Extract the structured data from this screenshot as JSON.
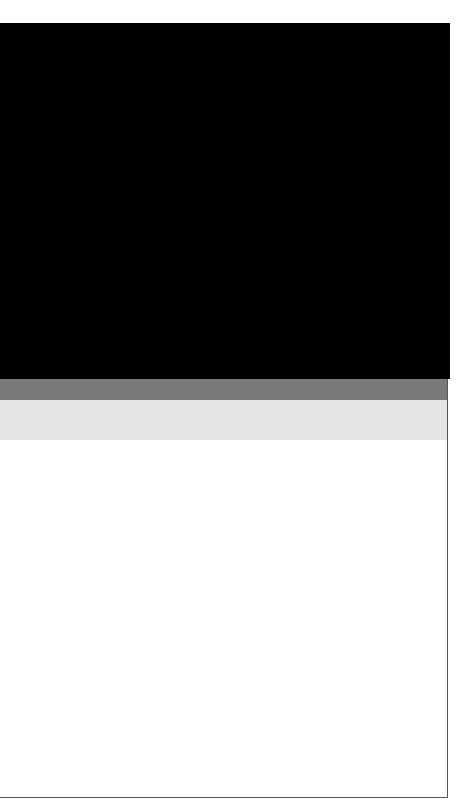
{
  "colors": {
    "top_panel": "#000000",
    "band_dark": "#7a7a7a",
    "band_light": "#e6e6e6",
    "content_bg": "#ffffff",
    "border": "#555555"
  }
}
